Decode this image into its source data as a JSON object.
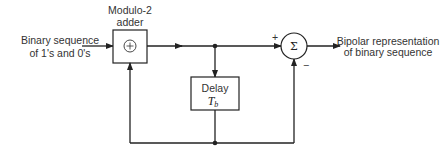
{
  "diagram": {
    "input_label": [
      "Binary sequence",
      "of 1's and 0's"
    ],
    "adder": {
      "label": [
        "Modulo-2",
        "adder"
      ],
      "symbol": "⊕"
    },
    "delay": {
      "label": "Delay",
      "symbol_main": "T",
      "symbol_sub": "b"
    },
    "summer": {
      "symbol": "Σ",
      "plus_sign": "+",
      "minus_sign": "−"
    },
    "output_label": [
      "Bipolar representation",
      "of binary sequence"
    ]
  }
}
